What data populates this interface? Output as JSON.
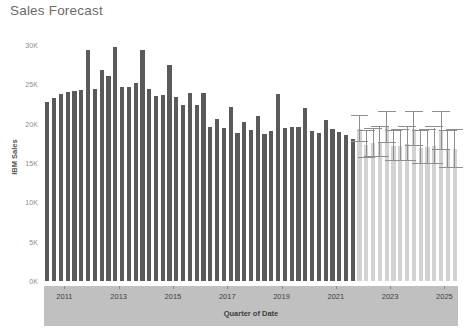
{
  "title": "Sales Forecast",
  "chart_data": {
    "type": "bar",
    "title": "Sales Forecast",
    "xlabel": "Quarter of Date",
    "ylabel": "IBM Sales",
    "ylim": [
      0,
      31500
    ],
    "grid": false,
    "legend": "none",
    "y_ticks": [
      {
        "value": 0,
        "label": "0K"
      },
      {
        "value": 5000,
        "label": "5K"
      },
      {
        "value": 10000,
        "label": "10K"
      },
      {
        "value": 15000,
        "label": "15K"
      },
      {
        "value": 20000,
        "label": "20K"
      },
      {
        "value": 25000,
        "label": "25K"
      },
      {
        "value": 30000,
        "label": "30K"
      }
    ],
    "x_ticks": [
      {
        "value": 2011,
        "label": "2011"
      },
      {
        "value": 2013,
        "label": "2013"
      },
      {
        "value": 2015,
        "label": "2015"
      },
      {
        "value": 2017,
        "label": "2017"
      },
      {
        "value": 2019,
        "label": "2019"
      },
      {
        "value": 2021,
        "label": "2021"
      },
      {
        "value": 2023,
        "label": "2023"
      },
      {
        "value": 2025,
        "label": "2025"
      }
    ],
    "x_start": 2010.25,
    "x_end": 2025.5,
    "colors": {
      "actual_bar": "#5a5a5a",
      "forecast_bar": "#d2d2d2",
      "error_bar": "#8e8e8e",
      "axis_band": "#c0c0c0",
      "title_text": "#6b6b6b",
      "tick_text": "#8c8c8c"
    },
    "series": [
      {
        "name": "Actual",
        "kind": "actual",
        "categories": [
          "2010 Q2",
          "2010 Q3",
          "2010 Q4",
          "2011 Q1",
          "2011 Q2",
          "2011 Q3",
          "2011 Q4",
          "2012 Q1",
          "2012 Q2",
          "2012 Q3",
          "2012 Q4",
          "2013 Q1",
          "2013 Q2",
          "2013 Q3",
          "2013 Q4",
          "2014 Q1",
          "2014 Q2",
          "2014 Q3",
          "2014 Q4",
          "2015 Q1",
          "2015 Q2",
          "2015 Q3",
          "2015 Q4",
          "2016 Q1",
          "2016 Q2",
          "2016 Q3",
          "2016 Q4",
          "2017 Q1",
          "2017 Q2",
          "2017 Q3",
          "2017 Q4",
          "2018 Q1",
          "2018 Q2",
          "2018 Q3",
          "2018 Q4",
          "2019 Q1",
          "2019 Q2",
          "2019 Q3",
          "2019 Q4",
          "2020 Q1",
          "2020 Q2",
          "2020 Q3",
          "2020 Q4",
          "2021 Q1",
          "2021 Q2",
          "2021 Q3"
        ],
        "values": [
          22700,
          23300,
          23700,
          24000,
          24100,
          24200,
          29300,
          24400,
          26800,
          26000,
          29700,
          24600,
          24700,
          25200,
          29400,
          24400,
          23500,
          23600,
          27500,
          23400,
          22300,
          23900,
          22400,
          23900,
          19600,
          20600,
          19400,
          22100,
          18800,
          20200,
          19200,
          21000,
          18700,
          19100,
          23700,
          19400,
          19600,
          19500,
          22000,
          19100,
          18800,
          20500,
          19300,
          18900,
          18600,
          18100
        ]
      },
      {
        "name": "Forecast",
        "kind": "forecast",
        "categories": [
          "2021 Q4",
          "2022 Q1",
          "2022 Q2",
          "2022 Q3",
          "2022 Q4",
          "2023 Q1",
          "2023 Q2",
          "2023 Q3",
          "2023 Q4",
          "2024 Q1",
          "2024 Q2",
          "2024 Q3",
          "2024 Q4",
          "2025 Q1",
          "2025 Q2"
        ],
        "values": [
          19300,
          17300,
          17500,
          17700,
          19500,
          17100,
          17200,
          17400,
          19300,
          16900,
          17000,
          17200,
          19100,
          16700,
          16800
        ],
        "ci_lower": [
          17700,
          15600,
          15700,
          15800,
          17500,
          15200,
          15200,
          15300,
          17100,
          14800,
          14800,
          14900,
          16700,
          14400,
          14400
        ],
        "ci_upper": [
          20900,
          19000,
          19300,
          19600,
          21500,
          19000,
          19200,
          19500,
          21500,
          19000,
          19200,
          19500,
          21500,
          19000,
          19200
        ]
      }
    ]
  }
}
